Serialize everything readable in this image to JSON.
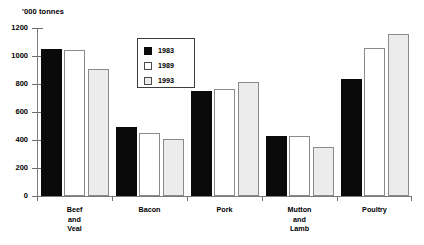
{
  "chart_data": {
    "type": "bar",
    "title": "",
    "ylabel": "'000 tonnes",
    "xlabel": "",
    "ylim": [
      0,
      1200
    ],
    "yticks": [
      0,
      200,
      400,
      600,
      800,
      1000,
      1200
    ],
    "ytick_labels": [
      "0",
      "200",
      "400",
      "600",
      "800",
      "1000",
      "1200"
    ],
    "grid": false,
    "legend_position": "inside-upper-center",
    "categories": [
      "Beef and Veal",
      "Bacon",
      "Pork",
      "Mutton and Lamb",
      "Poultry"
    ],
    "category_label_lines": [
      [
        "Beef",
        "and",
        "Veal"
      ],
      [
        "Bacon"
      ],
      [
        "Pork"
      ],
      [
        "Mutton",
        "and",
        "Lamb"
      ],
      [
        "Poultry"
      ]
    ],
    "series": [
      {
        "name": "1983",
        "color": "#0a0a0a",
        "values": [
          1050,
          490,
          750,
          425,
          835
        ]
      },
      {
        "name": "1989",
        "color": "#ffffff",
        "values": [
          1040,
          450,
          765,
          425,
          1060
        ]
      },
      {
        "name": "1993",
        "color": "#ececed",
        "values": [
          905,
          405,
          810,
          345,
          1155
        ]
      }
    ]
  },
  "legend": {
    "entries": [
      {
        "label": "1983"
      },
      {
        "label": "1989"
      },
      {
        "label": "1993"
      }
    ]
  }
}
